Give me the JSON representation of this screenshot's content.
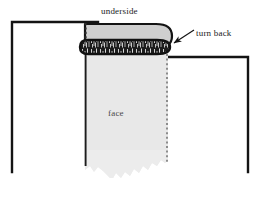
{
  "diagram": {
    "labels": {
      "underside": "underside",
      "turn_back": "turn back",
      "face": "face"
    },
    "colors": {
      "background": "#ffffff",
      "frame_line": "#141414",
      "fabric_face": "#e8e8e8",
      "fabric_underside": "#cfcfcf",
      "fold_band": "#1c1c1c",
      "dashed_line": "#5a5a5a",
      "label_text": "#1a1a1a",
      "face_label_text": "#4a4a4a"
    },
    "parts": [
      {
        "name": "left-frame",
        "role": "surface-outline-left",
        "shape": "open-rectangle",
        "corner_x": 12,
        "corner_y": 22
      },
      {
        "name": "right-frame",
        "role": "surface-outline-right",
        "shape": "open-rectangle",
        "corner_x": 248,
        "corner_y": 57
      },
      {
        "name": "fabric-face-panel",
        "role": "hanging-fabric-face",
        "left": 85,
        "right": 168,
        "top": 52,
        "bottom_ragged": true
      },
      {
        "name": "underside-strip",
        "role": "folded-over-underside",
        "left": 85,
        "right": 172,
        "top": 24,
        "rounded_right_end": true
      },
      {
        "name": "fold-band",
        "role": "stitched-rolled-edge",
        "texture": "irregular-hatch"
      },
      {
        "name": "fold-dashed-line",
        "role": "fold-crease-vertical",
        "x": 85,
        "style": "dotted"
      },
      {
        "name": "edge-dashed-line",
        "role": "turn-back-edge-vertical",
        "x": 167,
        "style": "dotted"
      },
      {
        "name": "turn-back-arrow",
        "role": "pointer-to-fold",
        "direction": "down-left",
        "tip_x": 170,
        "tip_y": 45
      }
    ]
  }
}
